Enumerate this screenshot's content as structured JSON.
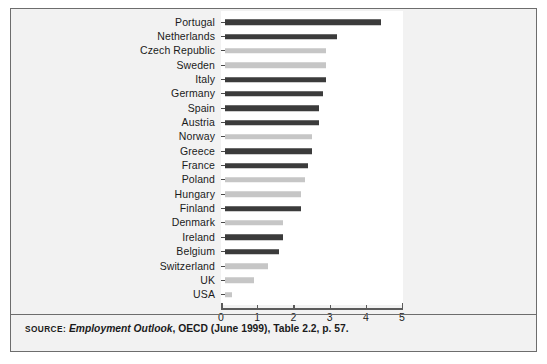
{
  "chart_data": {
    "type": "bar",
    "orientation": "horizontal",
    "title": "",
    "xlabel": "",
    "ylabel": "",
    "xlim": [
      0,
      5
    ],
    "xticks": [
      0,
      1,
      2,
      3,
      4,
      5
    ],
    "xtick_labels": [
      "0",
      "1",
      "2",
      "3",
      "4",
      "5"
    ],
    "grid": false,
    "legend": null,
    "categories": [
      "Portugal",
      "Netherlands",
      "Czech Republic",
      "Sweden",
      "Italy",
      "Germany",
      "Spain",
      "Austria",
      "Norway",
      "Greece",
      "France",
      "Poland",
      "Hungary",
      "Finland",
      "Denmark",
      "Ireland",
      "Belgium",
      "Switzerland",
      "UK",
      "USA"
    ],
    "values": [
      4.3,
      3.1,
      2.8,
      2.8,
      2.8,
      2.7,
      2.6,
      2.6,
      2.4,
      2.4,
      2.3,
      2.2,
      2.1,
      2.1,
      1.6,
      1.6,
      1.5,
      1.2,
      0.8,
      0.2
    ],
    "bar_colors": [
      "dark",
      "dark",
      "light",
      "light",
      "dark",
      "dark",
      "dark",
      "dark",
      "light",
      "dark",
      "dark",
      "light",
      "light",
      "dark",
      "light",
      "dark",
      "dark",
      "light",
      "light",
      "light"
    ],
    "colors": {
      "dark": "#3b3b3b",
      "light": "#c6c6c6",
      "axis": "#5b5b5b",
      "frame": "#6d6d6d",
      "plot_background": "#ffffff",
      "figure_background": "#f2f2f2"
    }
  },
  "source": {
    "prefix": "SOURCE:",
    "publication": "Employment Outlook",
    "rest": ", OECD (June 1999), Table 2.2, p. 57."
  }
}
